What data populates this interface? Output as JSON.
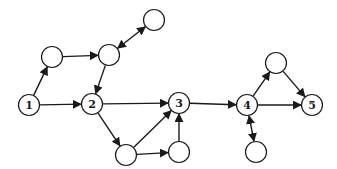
{
  "diagram": {
    "type": "directed-graph",
    "style": {
      "stroke": "#1a1a1a",
      "fill": "#ffffff",
      "node_radius": 10.5
    },
    "nodes": [
      {
        "id": "n1",
        "label": "1",
        "x": 29,
        "y": 105
      },
      {
        "id": "n2",
        "label": "2",
        "x": 92,
        "y": 104
      },
      {
        "id": "n3",
        "label": "3",
        "x": 179,
        "y": 103
      },
      {
        "id": "n4",
        "label": "4",
        "x": 247,
        "y": 105
      },
      {
        "id": "n5",
        "label": "5",
        "x": 312,
        "y": 105
      },
      {
        "id": "a",
        "label": "",
        "x": 52,
        "y": 57
      },
      {
        "id": "b",
        "label": "",
        "x": 109,
        "y": 55
      },
      {
        "id": "c",
        "label": "",
        "x": 154,
        "y": 20
      },
      {
        "id": "d",
        "label": "",
        "x": 126,
        "y": 155
      },
      {
        "id": "e",
        "label": "",
        "x": 179,
        "y": 152
      },
      {
        "id": "f",
        "label": "",
        "x": 276,
        "y": 63
      },
      {
        "id": "g",
        "label": "",
        "x": 256,
        "y": 152
      }
    ],
    "edges": [
      {
        "from": "n1",
        "to": "a",
        "bidirectional": false
      },
      {
        "from": "a",
        "to": "b",
        "bidirectional": false
      },
      {
        "from": "c",
        "to": "b",
        "bidirectional": true
      },
      {
        "from": "b",
        "to": "n2",
        "bidirectional": false
      },
      {
        "from": "n1",
        "to": "n2",
        "bidirectional": false
      },
      {
        "from": "n2",
        "to": "n3",
        "bidirectional": false
      },
      {
        "from": "n2",
        "to": "d",
        "bidirectional": false
      },
      {
        "from": "d",
        "to": "n3",
        "bidirectional": false
      },
      {
        "from": "d",
        "to": "e",
        "bidirectional": false
      },
      {
        "from": "e",
        "to": "n3",
        "bidirectional": false
      },
      {
        "from": "n3",
        "to": "n4",
        "bidirectional": false
      },
      {
        "from": "n4",
        "to": "f",
        "bidirectional": false
      },
      {
        "from": "f",
        "to": "n5",
        "bidirectional": false
      },
      {
        "from": "n4",
        "to": "n5",
        "bidirectional": false
      },
      {
        "from": "n4",
        "to": "g",
        "bidirectional": true
      }
    ]
  }
}
